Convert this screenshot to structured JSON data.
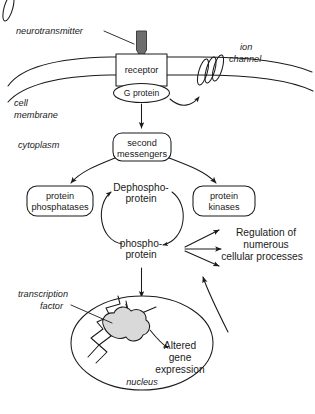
{
  "figure": {
    "background_color": "#ffffff",
    "ink_color": "#1a1a1a",
    "protein_fill_color": "#d9d9d9",
    "neurotransmitter_fill_color": "#6e6e6e"
  },
  "labels": {
    "neurotransmitter": "neurotransmitter",
    "ion_channel_line1": "ion",
    "ion_channel_line2": "channel",
    "receptor": "receptor",
    "g_protein": "G protein",
    "cell_membrane_line1": "cell",
    "cell_membrane_line2": "membrane",
    "cytoplasm": "cytoplasm",
    "second_messengers_line1": "second",
    "second_messengers_line2": "messengers",
    "protein_phosphatases_line1": "protein",
    "protein_phosphatases_line2": "phosphatases",
    "protein_kinases_line1": "protein",
    "protein_kinases_line2": "kinases",
    "dephospho_protein_line1": "Dephospho-",
    "dephospho_protein_line2": "protein",
    "phospho_protein_line1": "phospho-",
    "phospho_protein_line2": "protein",
    "regulation_line1": "Regulation of",
    "regulation_line2": "numerous",
    "regulation_line3": "cellular processes",
    "transcription_factor_line1": "transcription",
    "transcription_factor_line2": "factor",
    "altered_gene_line1": "Altered",
    "altered_gene_line2": "gene",
    "altered_gene_line3": "expression",
    "nucleus": "nucleus"
  }
}
